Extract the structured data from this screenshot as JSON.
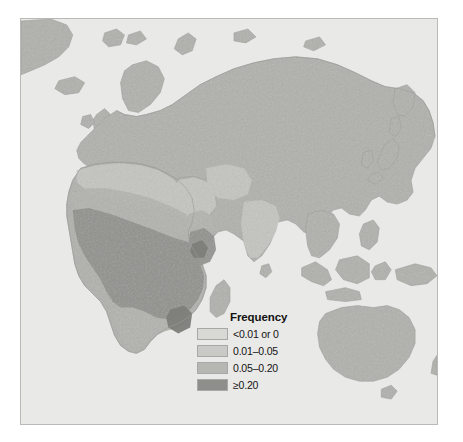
{
  "figure": {
    "type": "choropleth-map",
    "region": "Eastern Hemisphere (Africa, Europe, Asia, Australia)",
    "projection_extent": "Old World"
  },
  "legend": {
    "title": "Frequency",
    "entries": [
      {
        "label": "<0.01 or 0",
        "color": "#d8d8d4",
        "value_range": [
          0,
          0.01
        ]
      },
      {
        "label": "0.01–0.05",
        "color": "#c9c9c5",
        "value_range": [
          0.01,
          0.05
        ]
      },
      {
        "label": "0.05–0.20",
        "color": "#b6b6b2",
        "value_range": [
          0.05,
          0.2
        ]
      },
      {
        "label": "≥0.20",
        "color": "#8e8e8a",
        "value_range": [
          0.2,
          1.0
        ]
      }
    ]
  },
  "map_colors": {
    "ocean": "#e9e9e7",
    "land_base": "#b0b0ac",
    "land_outline": "#9a9a96",
    "class_0": "#d8d8d4",
    "class_1": "#c9c9c5",
    "class_2": "#b6b6b2",
    "class_3": "#8e8e8a",
    "frame": "#b9b9b7"
  },
  "map_regions": [
    {
      "name": "Europe",
      "frequency_class": "<0.01 or 0"
    },
    {
      "name": "North Africa",
      "frequency_class": "0.01–0.05"
    },
    {
      "name": "Sahel",
      "frequency_class": "0.05–0.20"
    },
    {
      "name": "West Africa",
      "frequency_class": "≥0.20"
    },
    {
      "name": "Central Africa",
      "frequency_class": "≥0.20"
    },
    {
      "name": "East Africa",
      "frequency_class": "≥0.20"
    },
    {
      "name": "Southern Africa",
      "frequency_class": "0.05–0.20"
    },
    {
      "name": "Arabian Peninsula",
      "frequency_class": "0.01–0.05"
    },
    {
      "name": "Middle East",
      "frequency_class": "0.01–0.05"
    },
    {
      "name": "South Asia",
      "frequency_class": "0.01–0.05"
    },
    {
      "name": "Siberia",
      "frequency_class": "<0.01 or 0"
    },
    {
      "name": "East Asia",
      "frequency_class": "<0.01 or 0"
    },
    {
      "name": "Southeast Asia",
      "frequency_class": "<0.01 or 0"
    },
    {
      "name": "Australia",
      "frequency_class": "<0.01 or 0"
    },
    {
      "name": "Greenland",
      "frequency_class": "<0.01 or 0"
    },
    {
      "name": "Iceland",
      "frequency_class": "<0.01 or 0"
    },
    {
      "name": "Madagascar",
      "frequency_class": "<0.01 or 0"
    }
  ]
}
